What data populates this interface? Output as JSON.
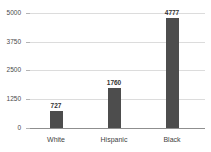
{
  "chart_data": {
    "type": "bar",
    "title": "",
    "subtitle": "",
    "xlabel": "",
    "ylabel": "",
    "categories": [
      "White",
      "Hispanic",
      "Black"
    ],
    "values": [
      727,
      1760,
      4777
    ],
    "data_labels": [
      "727",
      "1760",
      "4777"
    ],
    "ylim": [
      0,
      5000
    ],
    "yticks": [
      0,
      1250,
      2500,
      3750,
      5000
    ],
    "ytick_labels": [
      "0",
      "1250",
      "2500",
      "3750",
      "5000"
    ],
    "grid": "horizontal",
    "legend": "none",
    "series": [
      {
        "name": "",
        "values": [
          727,
          1760,
          4777
        ],
        "color": "#4d4d4d"
      }
    ],
    "colors": {
      "bar": "#4d4d4d",
      "gridline": "#dcdcdc",
      "axis": "#8f8f8f",
      "background": "#ffffff",
      "text": "#3a3a3a"
    }
  }
}
